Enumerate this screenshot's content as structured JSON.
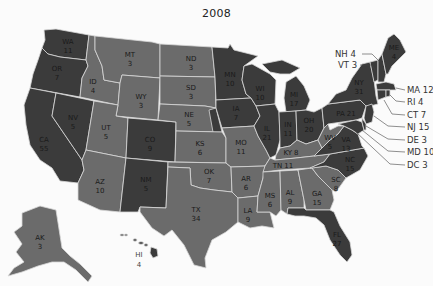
{
  "title": "2008",
  "colors": {
    "democrat": "#3b3b3b",
    "republican": "#6b6b6b",
    "border": "#d8d8d8",
    "background": "#fbfbfb"
  },
  "states": {
    "WA": {
      "abbr": "WA",
      "votes": "11",
      "party": "democrat"
    },
    "OR": {
      "abbr": "OR",
      "votes": "7",
      "party": "democrat"
    },
    "CA": {
      "abbr": "CA",
      "votes": "55",
      "party": "democrat"
    },
    "NV": {
      "abbr": "NV",
      "votes": "5",
      "party": "democrat"
    },
    "ID": {
      "abbr": "ID",
      "votes": "4",
      "party": "republican"
    },
    "MT": {
      "abbr": "MT",
      "votes": "3",
      "party": "republican"
    },
    "WY": {
      "abbr": "WY",
      "votes": "3",
      "party": "republican"
    },
    "UT": {
      "abbr": "UT",
      "votes": "5",
      "party": "republican"
    },
    "AZ": {
      "abbr": "AZ",
      "votes": "10",
      "party": "republican"
    },
    "CO": {
      "abbr": "CO",
      "votes": "9",
      "party": "democrat"
    },
    "NM": {
      "abbr": "NM",
      "votes": "5",
      "party": "democrat"
    },
    "ND": {
      "abbr": "ND",
      "votes": "3",
      "party": "republican"
    },
    "SD": {
      "abbr": "SD",
      "votes": "3",
      "party": "republican"
    },
    "NE": {
      "abbr": "NE",
      "votes": "5",
      "party": "republican"
    },
    "KS": {
      "abbr": "KS",
      "votes": "6",
      "party": "republican"
    },
    "OK": {
      "abbr": "OK",
      "votes": "7",
      "party": "republican"
    },
    "TX": {
      "abbr": "TX",
      "votes": "34",
      "party": "republican"
    },
    "MN": {
      "abbr": "MN",
      "votes": "10",
      "party": "democrat"
    },
    "IA": {
      "abbr": "IA",
      "votes": "7",
      "party": "democrat"
    },
    "MO": {
      "abbr": "MO",
      "votes": "11",
      "party": "republican"
    },
    "AR": {
      "abbr": "AR",
      "votes": "6",
      "party": "republican"
    },
    "LA": {
      "abbr": "LA",
      "votes": "9",
      "party": "republican"
    },
    "WI": {
      "abbr": "WI",
      "votes": "10",
      "party": "democrat"
    },
    "IL": {
      "abbr": "IL",
      "votes": "21",
      "party": "democrat"
    },
    "MI": {
      "abbr": "MI",
      "votes": "17",
      "party": "democrat"
    },
    "IN": {
      "abbr": "IN",
      "votes": "11",
      "party": "democrat"
    },
    "OH": {
      "abbr": "OH",
      "votes": "20",
      "party": "democrat"
    },
    "KY": {
      "abbr": "KY",
      "votes": "8",
      "party": "republican"
    },
    "TN": {
      "abbr": "TN",
      "votes": "11",
      "party": "republican"
    },
    "MS": {
      "abbr": "MS",
      "votes": "6",
      "party": "republican"
    },
    "AL": {
      "abbr": "AL",
      "votes": "9",
      "party": "republican"
    },
    "GA": {
      "abbr": "GA",
      "votes": "15",
      "party": "republican"
    },
    "FL": {
      "abbr": "FL",
      "votes": "27",
      "party": "democrat"
    },
    "SC": {
      "abbr": "SC",
      "votes": "8",
      "party": "republican"
    },
    "NC": {
      "abbr": "NC",
      "votes": "15",
      "party": "democrat"
    },
    "VA": {
      "abbr": "VA",
      "votes": "13",
      "party": "democrat"
    },
    "WV": {
      "abbr": "WV",
      "votes": "5",
      "party": "republican"
    },
    "PA": {
      "abbr": "PA",
      "votes": "21",
      "party": "democrat"
    },
    "NY": {
      "abbr": "NY",
      "votes": "31",
      "party": "democrat"
    },
    "ME": {
      "abbr": "ME",
      "votes": "4",
      "party": "democrat"
    },
    "AK": {
      "abbr": "AK",
      "votes": "3",
      "party": "republican"
    },
    "HI": {
      "abbr": "HI",
      "votes": "4",
      "party": "democrat"
    }
  },
  "callouts": {
    "NH": "NH 4",
    "VT": "VT 3",
    "MA": "MA 12",
    "RI": "RI 4",
    "CT": "CT 7",
    "NJ": "NJ 15",
    "DE": "DE 3",
    "MD": "MD 10",
    "DC": "DC 3"
  }
}
